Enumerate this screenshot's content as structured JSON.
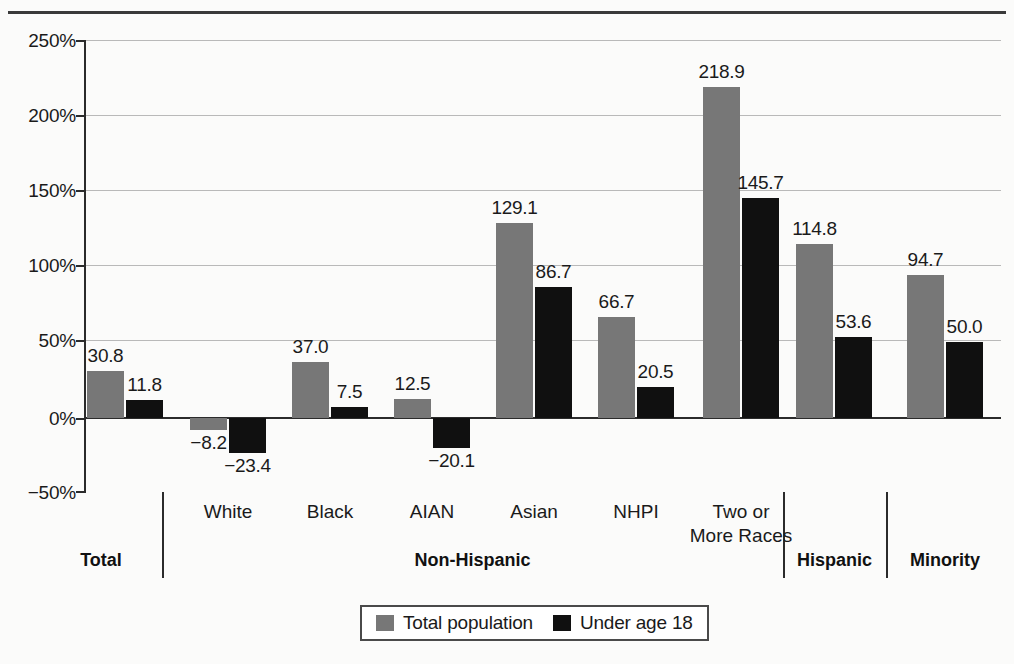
{
  "chart_data": {
    "type": "bar",
    "title": "",
    "xlabel": "",
    "ylabel": "",
    "ylim": [
      -50,
      250
    ],
    "y_ticks": [
      "-50%",
      "0%",
      "50%",
      "100%",
      "150%",
      "200%",
      "250%"
    ],
    "y_tick_values": [
      -50,
      0,
      50,
      100,
      150,
      200,
      250
    ],
    "grid": true,
    "legend_position": "bottom",
    "categories": [
      "Total",
      "White",
      "Black",
      "AIAN",
      "Asian",
      "NHPI",
      "Two or\nMore Races",
      "Hispanic",
      "Minority"
    ],
    "series": [
      {
        "name": "Total population",
        "color": "#777777",
        "values": [
          30.8,
          -8.2,
          37.0,
          12.5,
          129.1,
          66.7,
          218.9,
          114.8,
          94.7
        ],
        "labels": [
          "30.8",
          "−8.2",
          "37.0",
          "12.5",
          "129.1",
          "66.7",
          "218.9",
          "114.8",
          "94.7"
        ]
      },
      {
        "name": "Under age 18",
        "color": "#101010",
        "values": [
          11.8,
          -23.4,
          7.5,
          -20.1,
          86.7,
          20.5,
          145.7,
          53.6,
          50.0
        ],
        "labels": [
          "11.8",
          "−23.4",
          "7.5",
          "−20.1",
          "86.7",
          "20.5",
          "145.7",
          "53.6",
          "50.0"
        ]
      }
    ],
    "groups": [
      {
        "label": "Total",
        "categories": [
          "Total"
        ]
      },
      {
        "label": "Non-Hispanic",
        "categories": [
          "White",
          "Black",
          "AIAN",
          "Asian",
          "NHPI",
          "Two or More Races"
        ]
      },
      {
        "label": "Hispanic",
        "categories": [
          "Hispanic"
        ]
      },
      {
        "label": "Minority",
        "categories": [
          "Minority"
        ]
      }
    ]
  },
  "axis": {
    "y_labels": [
      "250%",
      "200%",
      "150%",
      "100%",
      "50%",
      "0%",
      "−50%"
    ]
  },
  "categories_display": [
    {
      "line1": "White",
      "line2": ""
    },
    {
      "line1": "Black",
      "line2": ""
    },
    {
      "line1": "AIAN",
      "line2": ""
    },
    {
      "line1": "Asian",
      "line2": ""
    },
    {
      "line1": "NHPI",
      "line2": ""
    },
    {
      "line1": "Two or",
      "line2": "More Races"
    }
  ],
  "group_labels": [
    "Total",
    "Non-Hispanic",
    "Hispanic",
    "Minority"
  ],
  "legend": {
    "items": [
      {
        "label": "Total population",
        "color": "#777777"
      },
      {
        "label": "Under age 18",
        "color": "#101010"
      }
    ]
  },
  "bar_values": {
    "total": [
      "30.8",
      "−8.2",
      "37.0",
      "12.5",
      "129.1",
      "66.7",
      "218.9",
      "114.8",
      "94.7"
    ],
    "under": [
      "11.8",
      "−23.4",
      "7.5",
      "−20.1",
      "86.7",
      "20.5",
      "145.7",
      "53.6",
      "50.0"
    ]
  }
}
